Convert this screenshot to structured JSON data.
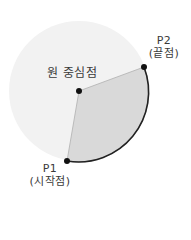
{
  "diagram": {
    "type": "circular-arc-sector",
    "circle": {
      "cx": 79,
      "cy": 91,
      "r": 70,
      "fill": "#f2f2f2"
    },
    "center_point": {
      "x": 79,
      "y": 91,
      "label": "원 중심점"
    },
    "start_point": {
      "x": 67,
      "y": 161,
      "label_line1": "P1",
      "label_line2": "(시작점)"
    },
    "end_point": {
      "x": 144,
      "y": 67,
      "label_line1": "P2",
      "label_line2": "(끝점)"
    },
    "sector": {
      "fill": "#d9d9d9",
      "edge_color": "#b0b0b0",
      "arc_color": "#222222",
      "direction": "counterclockwise"
    },
    "point_color": "#111111"
  }
}
